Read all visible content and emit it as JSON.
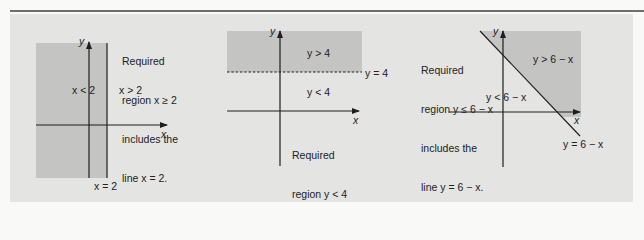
{
  "colors": {
    "background": "#f9f9f8",
    "panel": "#e4e4e2",
    "shaded_region": "#c4c4c2",
    "axis": "#1e1e1e",
    "rule": "#6e6e6e"
  },
  "graphs": [
    {
      "id": "x-ge-2",
      "axis_x_label": "x",
      "axis_y_label": "y",
      "boundary_label": "x = 2",
      "left_region_label": "x < 2",
      "right_region_label": "x > 2",
      "note_lines": [
        "Required",
        "region x ≥ 2",
        "includes the",
        "line x = 2."
      ]
    },
    {
      "id": "y-lt-4",
      "axis_x_label": "x",
      "axis_y_label": "y",
      "boundary_label": "y = 4",
      "upper_region_label": "y > 4",
      "lower_region_label": "y < 4",
      "note_lines": [
        "Required",
        "region y < 4",
        "does not",
        "include the",
        "line y = 4."
      ]
    },
    {
      "id": "y-le-6-minus-x",
      "axis_x_label": "x",
      "axis_y_label": "y",
      "boundary_label": "y = 6 − x",
      "upper_region_label": "y > 6 − x",
      "lower_region_label": "y < 6 − x",
      "note_lines": [
        "Required",
        "region y ≤ 6 − x",
        "includes the",
        "line y = 6 − x."
      ]
    }
  ]
}
